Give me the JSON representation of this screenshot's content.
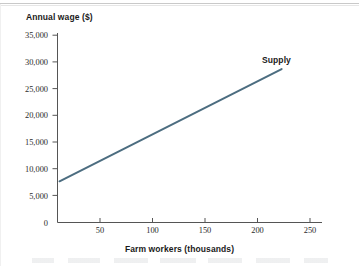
{
  "figure": {
    "background_color": "#ffffff",
    "axis_color": "#555555",
    "text_color": "#1a1a1a"
  },
  "chart_data": {
    "type": "line",
    "title": "",
    "xlabel": "Farm workers (thousands)",
    "ylabel": "Annual wage ($)",
    "xlim": [
      0,
      262
    ],
    "ylim": [
      0,
      36800
    ],
    "xticks": [
      50,
      100,
      150,
      200,
      250
    ],
    "xtick_labels": [
      "50",
      "100",
      "150",
      "200",
      "250"
    ],
    "yticks": [
      0,
      5000,
      10000,
      15000,
      20000,
      25000,
      30000,
      35000
    ],
    "ytick_labels": [
      "0",
      "5,000",
      "10,000",
      "15,000",
      "20,000",
      "25,000",
      "30,000",
      "35,000"
    ],
    "grid": false,
    "legend_position": "inline-right-of-line-end",
    "series": [
      {
        "name": "Supply",
        "color": "#4c6d80",
        "line_width": 2,
        "x": [
          2,
          222
        ],
        "y": [
          8000,
          29800
        ],
        "annotation": "Supply"
      }
    ]
  },
  "axes": {
    "y_title": "Annual wage ($)",
    "x_title": "Farm workers (thousands)"
  },
  "series_labels": {
    "supply": "Supply"
  }
}
